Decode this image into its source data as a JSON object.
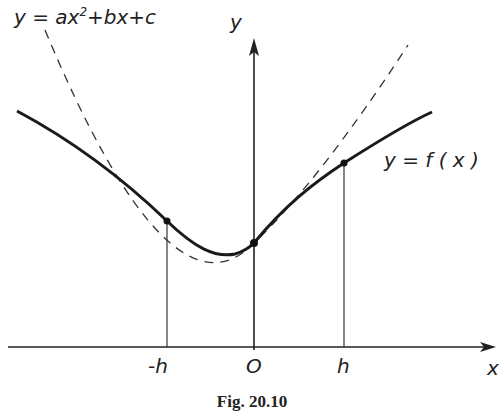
{
  "figure": {
    "caption": "Fig. 20.10",
    "axes": {
      "x_label": "x",
      "y_label": "y",
      "tick_labels": [
        "-h",
        "O",
        "h"
      ]
    },
    "curves": [
      {
        "name": "parabola",
        "style": "dashed",
        "label_prefix": "y = ax",
        "label_exp": "2",
        "label_suffix": "+bx+c"
      },
      {
        "name": "f",
        "style": "solid",
        "label": "y = f ( x )"
      }
    ],
    "points": [
      "(-h, f(-h))",
      "(0, f(0))",
      "(h, f(h))"
    ]
  }
}
